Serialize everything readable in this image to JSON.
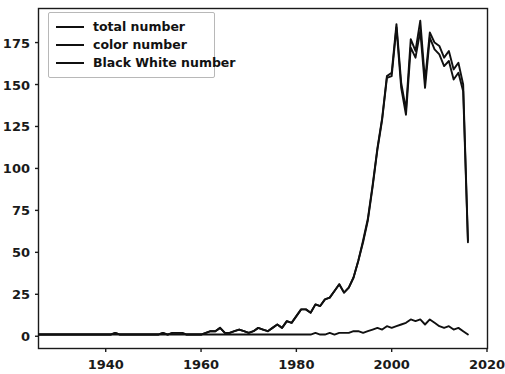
{
  "chart_data": {
    "type": "line",
    "title": "",
    "xlabel": "",
    "ylabel": "",
    "xlim": [
      1926,
      2020
    ],
    "ylim": [
      -7,
      195
    ],
    "grid": false,
    "legend_position": "upper left",
    "xticks": [
      1940,
      1960,
      1980,
      2000,
      2020
    ],
    "yticks": [
      0,
      25,
      50,
      75,
      100,
      125,
      150,
      175
    ],
    "line_color": "#101010",
    "x": [
      1926,
      1927,
      1928,
      1929,
      1930,
      1931,
      1932,
      1933,
      1934,
      1935,
      1936,
      1937,
      1938,
      1939,
      1940,
      1941,
      1942,
      1943,
      1944,
      1945,
      1946,
      1947,
      1948,
      1949,
      1950,
      1951,
      1952,
      1953,
      1954,
      1955,
      1956,
      1957,
      1958,
      1959,
      1960,
      1961,
      1962,
      1963,
      1964,
      1965,
      1966,
      1967,
      1968,
      1969,
      1970,
      1971,
      1972,
      1973,
      1974,
      1975,
      1976,
      1977,
      1978,
      1979,
      1980,
      1981,
      1982,
      1983,
      1984,
      1985,
      1986,
      1987,
      1988,
      1989,
      1990,
      1991,
      1992,
      1993,
      1994,
      1995,
      1996,
      1997,
      1998,
      1999,
      2000,
      2001,
      2002,
      2003,
      2004,
      2005,
      2006,
      2007,
      2008,
      2009,
      2010,
      2011,
      2012,
      2013,
      2014,
      2015,
      2016
    ],
    "series": [
      {
        "name": "total number",
        "values": [
          1,
          1,
          1,
          1,
          1,
          1,
          1,
          1,
          1,
          1,
          1,
          1,
          1,
          1,
          1,
          1,
          2,
          1,
          1,
          1,
          1,
          1,
          1,
          1,
          1,
          1,
          2,
          1,
          2,
          2,
          2,
          1,
          1,
          1,
          1,
          2,
          3,
          3,
          5,
          2,
          2,
          3,
          4,
          3,
          2,
          3,
          5,
          4,
          3,
          5,
          7,
          5,
          9,
          8,
          12,
          16,
          16,
          14,
          19,
          18,
          22,
          23,
          27,
          31,
          26,
          29,
          35,
          45,
          57,
          70,
          90,
          112,
          130,
          155,
          157,
          186,
          151,
          135,
          177,
          170,
          188,
          152,
          181,
          175,
          173,
          166,
          170,
          159,
          163,
          150,
          57
        ]
      },
      {
        "name": "color number",
        "values": [
          1,
          1,
          1,
          1,
          1,
          1,
          1,
          1,
          1,
          1,
          1,
          1,
          1,
          1,
          1,
          1,
          2,
          1,
          1,
          1,
          1,
          1,
          1,
          1,
          1,
          1,
          2,
          1,
          2,
          2,
          2,
          1,
          1,
          1,
          1,
          2,
          3,
          3,
          5,
          2,
          2,
          3,
          4,
          3,
          2,
          3,
          5,
          4,
          3,
          5,
          7,
          5,
          9,
          8,
          12,
          16,
          16,
          14,
          19,
          18,
          22,
          23,
          27,
          31,
          26,
          29,
          35,
          45,
          56,
          69,
          89,
          111,
          129,
          154,
          155,
          184,
          148,
          132,
          172,
          166,
          182,
          148,
          178,
          171,
          168,
          161,
          164,
          153,
          157,
          146,
          56
        ]
      },
      {
        "name": "Black White number",
        "values": [
          1,
          1,
          1,
          1,
          1,
          1,
          1,
          1,
          1,
          1,
          1,
          1,
          1,
          1,
          1,
          1,
          1,
          1,
          1,
          1,
          1,
          1,
          1,
          1,
          1,
          1,
          1,
          1,
          1,
          1,
          1,
          1,
          1,
          1,
          1,
          1,
          1,
          1,
          1,
          1,
          1,
          1,
          1,
          1,
          1,
          1,
          1,
          1,
          1,
          1,
          1,
          1,
          1,
          1,
          1,
          1,
          1,
          1,
          2,
          1,
          1,
          2,
          1,
          2,
          2,
          2,
          3,
          3,
          2,
          3,
          4,
          5,
          4,
          6,
          5,
          6,
          7,
          8,
          10,
          9,
          10,
          7,
          10,
          8,
          6,
          5,
          6,
          4,
          5,
          3,
          1
        ]
      }
    ]
  },
  "legend": {
    "entries": [
      {
        "label": "total number"
      },
      {
        "label": "color number"
      },
      {
        "label": "Black White number"
      }
    ]
  },
  "axes": {
    "ytick_labels": [
      "175",
      "150",
      "125",
      "100",
      "75",
      "50",
      "25",
      "0"
    ],
    "xtick_labels": [
      "1940",
      "1960",
      "1980",
      "2000",
      "2020"
    ]
  }
}
